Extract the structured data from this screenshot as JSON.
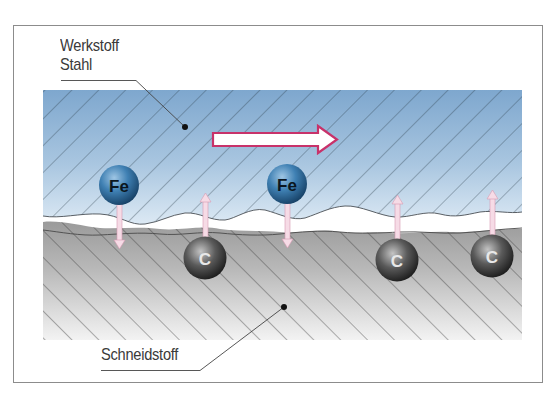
{
  "diagram": {
    "labels": {
      "workpiece_line1": "Werkstoff",
      "workpiece_line2": "Stahl",
      "tool": "Schneidstoff"
    },
    "atoms": {
      "fe_symbol": "Fe",
      "c_symbol": "C",
      "fe": [
        {
          "symbol": "Fe",
          "x": 119,
          "y": 185,
          "direction": "down"
        },
        {
          "symbol": "Fe",
          "x": 287,
          "y": 184,
          "direction": "down"
        }
      ],
      "c": [
        {
          "symbol": "C",
          "x": 205,
          "y": 258,
          "direction": "up"
        },
        {
          "symbol": "C",
          "x": 397,
          "y": 260,
          "direction": "up"
        },
        {
          "symbol": "C",
          "x": 492,
          "y": 256,
          "direction": "up"
        }
      ]
    },
    "motion_arrow": {
      "direction": "right"
    },
    "colors": {
      "steel_top": "#7fa8cf",
      "steel_bottom": "#dbe9f4",
      "tool_top": "#8a8a8a",
      "tool_bottom": "#f2f2f2",
      "arrow_outline": "#c8326a",
      "diffusion_arrow_fill": "#f6dbe6",
      "fe_ball": "#2f6f9f",
      "c_ball": "#3a3a3a",
      "frame": "#8c8c8c"
    }
  }
}
